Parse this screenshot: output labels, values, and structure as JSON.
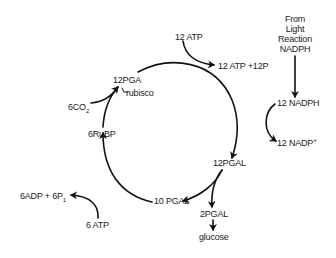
{
  "diagram": {
    "type": "Calvin cycle",
    "labels": {
      "pga": "12PGA",
      "rubisco": "rubisco",
      "co2_prefix": "6CO",
      "co2_sub": "2",
      "rubp": "6RuBP",
      "atp_in": "12 ATP",
      "atp_out": "12 ATP +12P",
      "light_line1": "From",
      "light_line2": "Light",
      "light_line3": "Reaction",
      "light_line4": "NADPH",
      "nadph": "12 NADPH",
      "nadp_prefix": "12 NADP",
      "nadp_sup": "+",
      "pgal12": "12PGAL",
      "pgal10": "10 PGAL",
      "pgal2": "2PGAL",
      "glucose": "glucose",
      "adp_prefix": "6ADP + 6P",
      "adp_sub": "1",
      "atp6": "6 ATP"
    },
    "nodes": [
      "12PGA",
      "12PGAL",
      "10 PGAL",
      "6RuBP"
    ],
    "edges": [
      {
        "from": "12PGA",
        "to": "12PGAL",
        "inputs": [
          "12 ATP",
          "12 NADPH"
        ],
        "outputs": [
          "12 ATP +12P",
          "12 NADP+"
        ]
      },
      {
        "from": "12PGAL",
        "to": "10 PGAL"
      },
      {
        "from": "12PGAL",
        "to": "2PGAL"
      },
      {
        "from": "2PGAL",
        "to": "glucose"
      },
      {
        "from": "10 PGAL",
        "to": "6RuBP",
        "inputs": [
          "6 ATP"
        ],
        "outputs": [
          "6ADP + 6P1"
        ]
      },
      {
        "from": "6RuBP",
        "to": "12PGA",
        "inputs": [
          "6CO2"
        ],
        "enzyme": "rubisco"
      },
      {
        "from": "From Light Reaction NADPH",
        "to": "12 NADPH"
      }
    ],
    "stroke_color": "#111111",
    "background": "#ffffff"
  }
}
